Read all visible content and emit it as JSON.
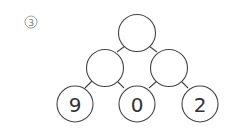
{
  "problem": {
    "label": "③",
    "top": "",
    "middle": [
      "",
      ""
    ],
    "bottom": [
      "9",
      "0",
      "2"
    ]
  }
}
